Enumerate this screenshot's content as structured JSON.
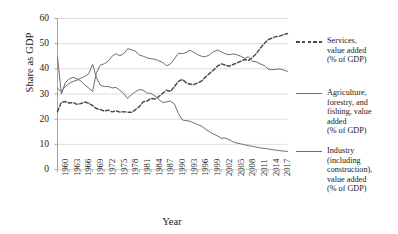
{
  "chart_data": {
    "type": "line",
    "title": "",
    "xlabel": "Year",
    "ylabel": "Share as GDP",
    "xlim": [
      1960,
      2019
    ],
    "ylim": [
      0,
      60
    ],
    "grid": true,
    "legend_position": "right",
    "y_ticks": [
      0,
      10,
      20,
      30,
      40,
      50,
      60
    ],
    "x_ticks": [
      1960,
      1963,
      1966,
      1969,
      1972,
      1975,
      1978,
      1981,
      1984,
      1987,
      1990,
      1993,
      1996,
      1999,
      2002,
      2005,
      2008,
      2011,
      2014,
      2017
    ],
    "x": [
      1960,
      1961,
      1962,
      1963,
      1964,
      1965,
      1966,
      1967,
      1968,
      1969,
      1970,
      1971,
      1972,
      1973,
      1974,
      1975,
      1976,
      1977,
      1978,
      1979,
      1980,
      1981,
      1982,
      1983,
      1984,
      1985,
      1986,
      1987,
      1988,
      1989,
      1990,
      1991,
      1992,
      1993,
      1994,
      1995,
      1996,
      1997,
      1998,
      1999,
      2000,
      2001,
      2002,
      2003,
      2004,
      2005,
      2006,
      2007,
      2008,
      2009,
      2010,
      2011,
      2012,
      2013,
      2014,
      2015,
      2016,
      2017,
      2018,
      2019
    ],
    "series": [
      {
        "name": "Services, value added (% of GDP)",
        "style": "dashed",
        "color": "#4d4d4d",
        "values": [
          23.0,
          26.8,
          27.0,
          26.4,
          26.6,
          25.9,
          26.2,
          26.8,
          26.4,
          25.4,
          24.2,
          23.8,
          23.2,
          23.6,
          22.9,
          23.3,
          22.8,
          23.0,
          22.8,
          22.7,
          23.8,
          25.0,
          26.9,
          27.2,
          28.3,
          28.0,
          29.0,
          30.3,
          31.5,
          31.0,
          33.0,
          35.0,
          35.8,
          34.5,
          33.9,
          33.8,
          34.4,
          35.2,
          36.8,
          38.2,
          39.5,
          41.0,
          42.0,
          41.5,
          41.0,
          41.7,
          42.3,
          43.0,
          43.7,
          43.4,
          44.5,
          46.0,
          48.2,
          50.0,
          51.6,
          52.2,
          52.8,
          53.0,
          53.6,
          54.0
        ]
      },
      {
        "name": "Agriculture, forestry, and fishing, value added (% of GDP)",
        "style": "solid",
        "color": "#6e6e6e",
        "values": [
          32.2,
          31.0,
          33.0,
          34.2,
          35.0,
          35.5,
          36.3,
          37.0,
          38.0,
          41.8,
          36.4,
          33.5,
          33.0,
          33.0,
          32.4,
          32.6,
          31.5,
          30.2,
          28.2,
          29.8,
          30.9,
          31.8,
          31.5,
          30.4,
          30.2,
          29.2,
          27.8,
          26.6,
          26.9,
          27.2,
          26.0,
          22.3,
          19.7,
          19.4,
          19.2,
          18.5,
          17.8,
          17.2,
          16.0,
          15.0,
          14.1,
          13.4,
          12.4,
          12.5,
          11.9,
          11.0,
          10.5,
          10.2,
          9.8,
          9.5,
          9.2,
          8.9,
          8.6,
          8.4,
          8.2,
          7.9,
          7.7,
          7.5,
          7.3,
          7.2
        ]
      },
      {
        "name": "Industry (including construction), value added (% of GDP)",
        "style": "solid",
        "color": "#6e6e6e",
        "values": [
          44.5,
          30.0,
          34.5,
          36.0,
          36.6,
          36.0,
          35.2,
          33.6,
          32.4,
          31.0,
          38.5,
          41.5,
          42.0,
          43.0,
          45.0,
          46.0,
          45.2,
          46.0,
          48.0,
          47.6,
          47.0,
          45.5,
          45.0,
          44.3,
          44.0,
          43.8,
          43.2,
          42.5,
          41.2,
          42.0,
          44.0,
          46.2,
          46.0,
          46.5,
          47.4,
          46.5,
          45.6,
          45.0,
          44.8,
          45.6,
          46.8,
          47.5,
          46.8,
          46.0,
          45.6,
          45.9,
          45.6,
          45.0,
          44.2,
          44.8,
          43.0,
          42.8,
          42.0,
          41.3,
          40.0,
          39.6,
          39.8,
          40.0,
          39.5,
          39.0
        ]
      }
    ]
  },
  "legend": {
    "items": [
      {
        "label": "Services, value added (% of GDP)",
        "style": "dashed",
        "color": "#4d4d4d"
      },
      {
        "label": "Agriculture, forestry, and fishing, value added (% of GDP)",
        "style": "solid",
        "color": "#6e6e6e"
      },
      {
        "label": "Industry (including construction), value added (% of GDP)",
        "style": "solid",
        "color": "#6e6e6e"
      }
    ]
  },
  "axes": {
    "y_title": "Share as GDP",
    "x_title": "Year"
  },
  "colors": {
    "gridline": "#d4d4d4",
    "axis": "#9a9a9a",
    "text": "#1a1a1a"
  }
}
